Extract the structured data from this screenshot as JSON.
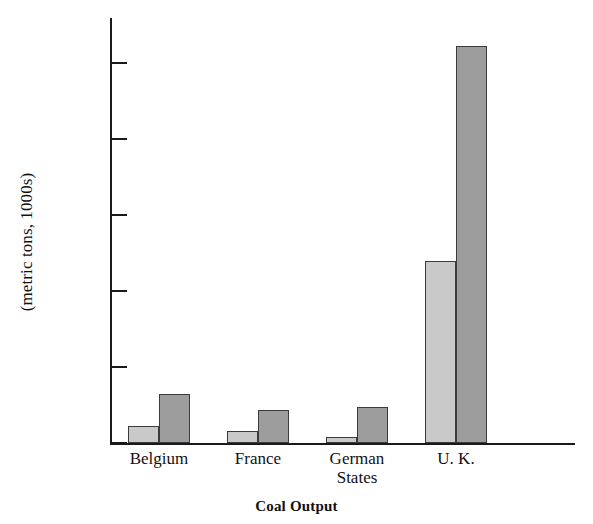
{
  "chart_data": {
    "type": "bar",
    "title": "Coal Output",
    "xlabel": "",
    "ylabel": "(metric tons, 1000s)",
    "categories": [
      "Belgium",
      "France",
      "German\nStates",
      "U. K."
    ],
    "series": [
      {
        "name": "series-1",
        "color": "#c9c9c9",
        "values": [
          2200,
          1600,
          800,
          24000
        ]
      },
      {
        "name": "series-2",
        "color": "#9d9d9d",
        "values": [
          6400,
          4300,
          4800,
          52300
        ]
      }
    ],
    "ylim": [
      0,
      55000
    ],
    "yticks": [
      0,
      10000,
      20000,
      30000,
      40000,
      50000
    ],
    "ytick_labels": [
      "0",
      "10,000",
      "20,000",
      "30,000",
      "40,000",
      "50,000"
    ],
    "grid": false,
    "legend": "none"
  }
}
